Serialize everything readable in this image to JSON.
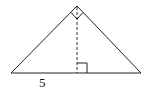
{
  "figure": {
    "type": "right isosceles triangle with altitude",
    "labels": {
      "base_left_segment": "5"
    },
    "colors": {
      "stroke": "#222222",
      "background": "#ffffff"
    },
    "annotations": [
      "right angle at apex",
      "dashed altitude from apex to base",
      "right angle marker at foot of altitude"
    ]
  }
}
